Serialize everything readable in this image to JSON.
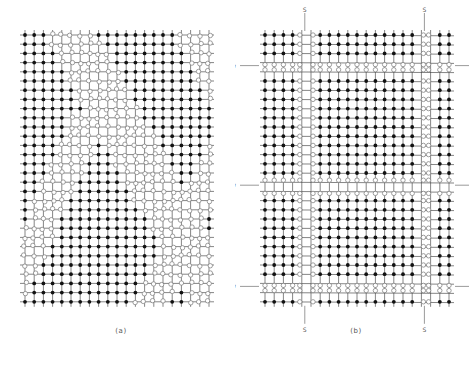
{
  "figure": {
    "panels": [
      {
        "id": "a",
        "caption": "(a)",
        "grid": {
          "cols": 21,
          "rows": 30,
          "x0": 25,
          "y0": 35,
          "dx": 9.2,
          "dy": 9.2
        },
        "pattern": "diagonal-bands",
        "markers": []
      },
      {
        "id": "b",
        "caption": "(b)",
        "grid": {
          "cols": 21,
          "rows": 30,
          "x0": 30,
          "y0": 35,
          "dx": 9.2,
          "dy": 9.2
        },
        "pattern": "rectangular-walls",
        "wall_cols": [
          4,
          5,
          17,
          18
        ],
        "wall_rows": [
          3,
          4,
          16,
          17,
          27,
          28
        ],
        "markers": [
          {
            "type": "S",
            "side": "top",
            "col": 4,
            "label": "S"
          },
          {
            "type": "S",
            "side": "top",
            "col": 17,
            "label": "S"
          },
          {
            "type": "S",
            "side": "bottom",
            "col": 4,
            "label": "S"
          },
          {
            "type": "S",
            "side": "bottom",
            "col": 17,
            "label": "S"
          },
          {
            "type": "W",
            "side": "left",
            "row": 3,
            "label": "w"
          },
          {
            "type": "W",
            "side": "left",
            "row": 16,
            "label": "w"
          },
          {
            "type": "W",
            "side": "left",
            "row": 27,
            "label": "w"
          },
          {
            "type": "W",
            "side": "right",
            "row": 3,
            "label": "w"
          },
          {
            "type": "W",
            "side": "right",
            "row": 16,
            "label": "w"
          },
          {
            "type": "W",
            "side": "right",
            "row": 27,
            "label": "w"
          }
        ]
      }
    ],
    "colors": {
      "line": "#333333",
      "solid_atom": "#111111",
      "open_atom": "#777777",
      "marker": "#555555"
    },
    "legend": {
      "solid": "filled atom",
      "open": "open atom (displaced)"
    }
  }
}
